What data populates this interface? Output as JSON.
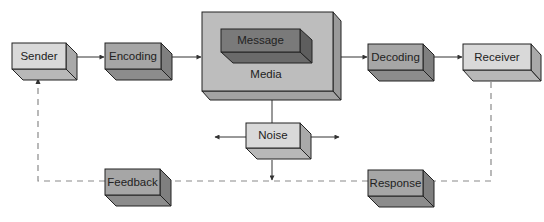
{
  "diagram": {
    "type": "communication-process-model",
    "colors": {
      "light_front": "#d9d9d9",
      "light_side": "#a9a9a9",
      "light_bottom": "#b8b8b8",
      "mid_front": "#a6a6a6",
      "mid_side": "#7f7f7f",
      "mid_bottom": "#8c8c8c",
      "dark_front": "#7a7a7a",
      "dark_side": "#5e5e5e",
      "dark_bottom": "#6a6a6a",
      "media_front": "#bdbdbd",
      "media_side": "#9a9a9a",
      "media_bottom": "#a3a3a3",
      "line": "#333333",
      "dash": "#8a8a8a"
    },
    "nodes": {
      "sender": {
        "label": "Sender"
      },
      "encoding": {
        "label": "Encoding"
      },
      "media": {
        "label": "Media"
      },
      "message": {
        "label": "Message"
      },
      "decoding": {
        "label": "Decoding"
      },
      "receiver": {
        "label": "Receiver"
      },
      "noise": {
        "label": "Noise"
      },
      "feedback": {
        "label": "Feedback"
      },
      "response": {
        "label": "Response"
      }
    },
    "edges": [
      {
        "from": "Sender",
        "to": "Encoding",
        "style": "solid"
      },
      {
        "from": "Encoding",
        "to": "Media",
        "style": "solid"
      },
      {
        "from": "Media",
        "to": "Decoding",
        "style": "solid"
      },
      {
        "from": "Decoding",
        "to": "Receiver",
        "style": "solid"
      },
      {
        "from": "Noise",
        "to": "Media",
        "style": "solid"
      },
      {
        "from": "Noise",
        "to": "left",
        "style": "solid"
      },
      {
        "from": "Noise",
        "to": "right",
        "style": "solid"
      },
      {
        "from": "Noise",
        "to": "feedback-loop",
        "style": "solid"
      },
      {
        "from": "Receiver",
        "to": "Response",
        "style": "dashed"
      },
      {
        "from": "Response",
        "to": "Feedback",
        "style": "dashed"
      },
      {
        "from": "Feedback",
        "to": "Sender",
        "style": "dashed"
      }
    ]
  }
}
